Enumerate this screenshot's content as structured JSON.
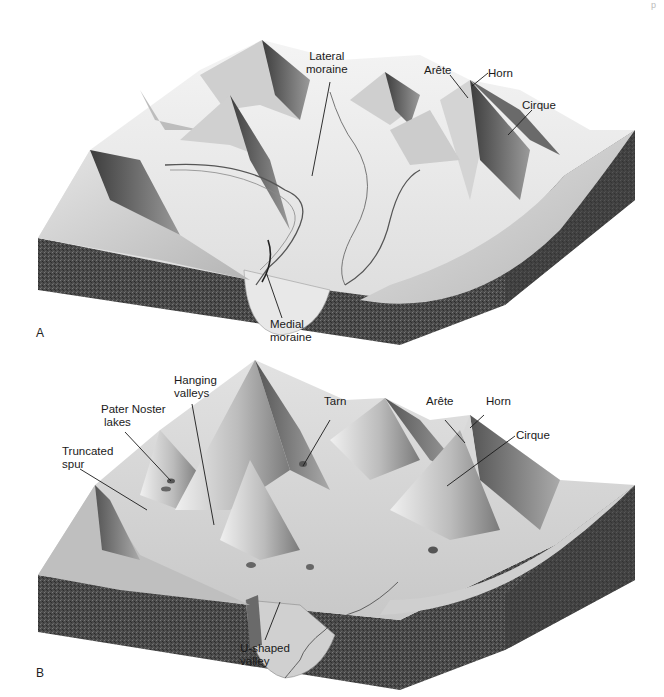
{
  "figure": {
    "page_mark": "p",
    "panels": [
      {
        "id": "A",
        "letter": "A",
        "labels": {
          "lateral_moraine": [
            "Lateral",
            "moraine"
          ],
          "arete": "Arête",
          "horn": "Horn",
          "cirque": "Cirque",
          "medial_moraine": [
            "Medial",
            "moraine"
          ]
        }
      },
      {
        "id": "B",
        "letter": "B",
        "labels": {
          "hanging_valleys": [
            "Hanging",
            "valleys"
          ],
          "pater_noster_lakes": [
            "Pater Noster",
            "lakes"
          ],
          "truncated_spur": [
            "Truncated",
            "spur"
          ],
          "tarn": "Tarn",
          "arete": "Arête",
          "horn": "Horn",
          "cirque": "Cirque",
          "u_shaped_valley": [
            "U-shaped",
            "valley"
          ]
        }
      }
    ],
    "colors": {
      "bedrock": "#4a4a4a",
      "bedrock_dark": "#333333",
      "ice": "#ececec",
      "rock_face_light": "#d6d6d6",
      "rock_face_mid": "#a8a8a8",
      "rock_face_dark": "#5e5e5e",
      "leader_line": "#1a1a1a"
    }
  }
}
